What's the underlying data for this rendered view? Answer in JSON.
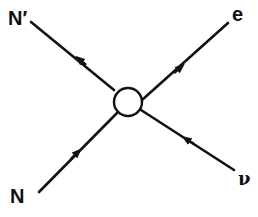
{
  "diagram": {
    "type": "feynman-vertex",
    "vertex": {
      "shape": "circle",
      "center": [
        128,
        102
      ],
      "radius": 14,
      "stroke_color": "#111111",
      "fill_color": "#ffffff"
    },
    "legs": [
      {
        "id": "n-prime",
        "label": "N′",
        "direction": "outgoing",
        "from": [
          114,
          90
        ],
        "to": [
          31,
          22
        ],
        "arrow_at": [
          81,
          61
        ]
      },
      {
        "id": "e",
        "label": "e",
        "direction": "outgoing",
        "from": [
          142,
          100
        ],
        "to": [
          228,
          23
        ],
        "arrow_at": [
          179,
          69
        ]
      },
      {
        "id": "n",
        "label": "N",
        "direction": "incoming",
        "from": [
          39,
          192
        ],
        "to": [
          117,
          113
        ],
        "arrow_at": [
          76,
          154
        ]
      },
      {
        "id": "nu",
        "label": "ν",
        "direction": "incoming",
        "from": [
          234,
          170
        ],
        "to": [
          141,
          110
        ],
        "arrow_at": [
          188,
          140
        ]
      }
    ],
    "line_color": "#111111"
  },
  "labels": {
    "n_prime": "N′",
    "e": "e",
    "n": "N",
    "nu": "ν"
  }
}
